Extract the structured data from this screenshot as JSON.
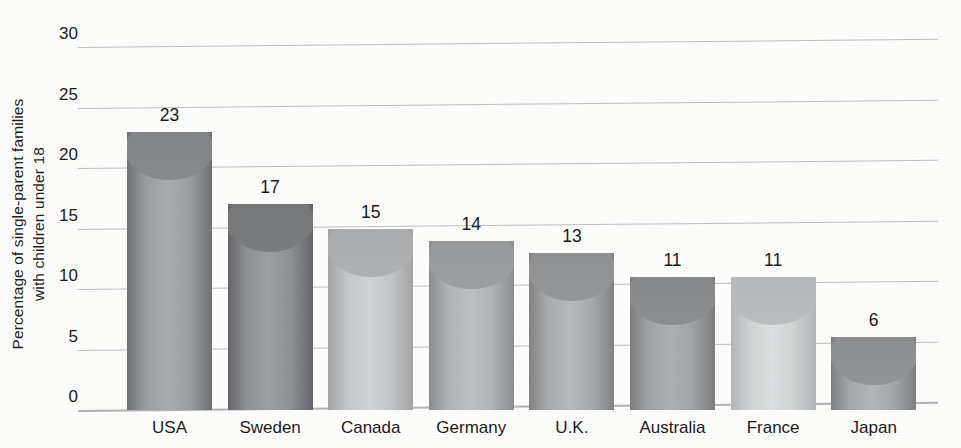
{
  "chart_data": {
    "type": "bar",
    "title": "",
    "xlabel": "",
    "ylabel": "Percentage of single-parent families with children under 18",
    "ylabel_line1": "Percentage of single-parent families",
    "ylabel_line2": "with children under 18",
    "categories": [
      "USA",
      "Sweden",
      "Canada",
      "Germany",
      "U.K.",
      "Australia",
      "France",
      "Japan"
    ],
    "values": [
      23,
      17,
      15,
      14,
      13,
      11,
      11,
      6
    ],
    "value_labels": [
      "23",
      "17",
      "15",
      "14",
      "13",
      "11",
      "11",
      "6"
    ],
    "ylim": [
      0,
      30
    ],
    "yticks": [
      0,
      5,
      10,
      15,
      20,
      25,
      30
    ],
    "ytick_labels": [
      "0",
      "5",
      "10",
      "15",
      "20",
      "25",
      "30"
    ],
    "grid": true,
    "grid_axis": "y",
    "legend": false,
    "bar_style": "cylinder",
    "bar_colors": [
      "#9b9d9f",
      "#8e9092",
      "#c3c5c6",
      "#b0b2b3",
      "#a8aaac",
      "#a0a2a4",
      "#cfd1d2",
      "#a5a7a9"
    ],
    "bar_edge_colors": [
      "#6f7173",
      "#63656a",
      "#a2a4a6",
      "#8b8d8f",
      "#7f8183",
      "#7a7c7e",
      "#b4b6b8",
      "#7c7e80"
    ],
    "grid_color": "#b7b9bb",
    "text_color": "#1b1b1b",
    "background_color": "#fdfdfb"
  }
}
